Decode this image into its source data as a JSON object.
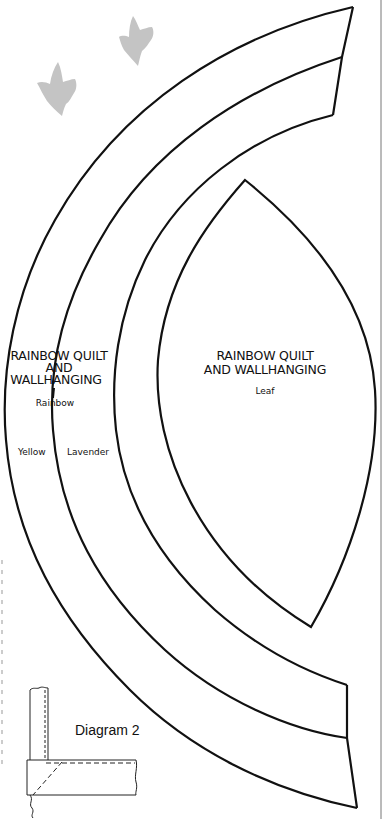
{
  "pattern": {
    "rainbow_piece": {
      "title_line1": "RAINBOW QUILT",
      "title_line2": "AND",
      "title_line3": "WALLHANGING",
      "piece_name": "Rainbow",
      "band_labels": [
        "Yellow",
        "Lavender"
      ]
    },
    "leaf_piece": {
      "title_line1": "RAINBOW QUILT",
      "title_line2": "AND WALLHANGING",
      "piece_name": "Leaf"
    },
    "diagram": {
      "label": "Diagram 2"
    },
    "decorations": [
      "bird-silhouette",
      "bird-silhouette"
    ],
    "colors": {
      "line": "#111111",
      "bird": "#c4c4c4",
      "background": "#ffffff"
    }
  }
}
